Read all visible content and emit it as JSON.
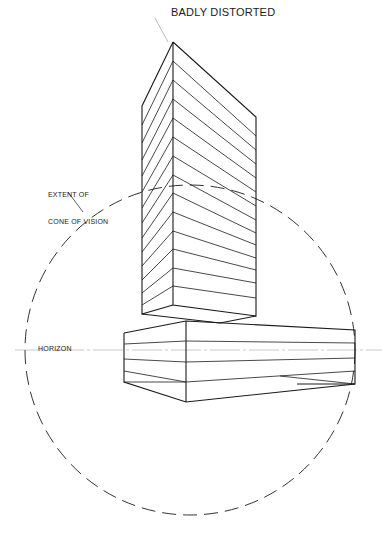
{
  "labels": {
    "title": "BADLY DISTORTED",
    "cone_line1": "EXTENT OF",
    "cone_line2": "CONE OF VISION",
    "horizon": "HORIZON"
  },
  "colors": {
    "ink": "#1a1a1a",
    "dashed": "#333333",
    "leader": "#bbbbbb",
    "background": "#ffffff"
  },
  "figure": {
    "cone_of_vision": {
      "cx": 190,
      "cy": 350,
      "r": 165
    },
    "horizon_y": 350,
    "tall_block_courses": 12,
    "low_block_courses": 3
  }
}
